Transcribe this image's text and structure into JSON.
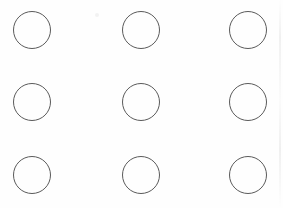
{
  "canvas": {
    "width": 283,
    "height": 208,
    "background_color": "#fefefe",
    "title": "Circle Grid"
  },
  "grid": {
    "rows": 3,
    "columns": 3,
    "shape": "circle",
    "count": 9,
    "circle_diameter": 37,
    "circle_radius": 18.5,
    "stroke_color": "#5a5a5a",
    "stroke_width": 1,
    "fill": "none",
    "column_centers_x": [
      31.5,
      140.5,
      247.5
    ],
    "row_centers_y": [
      29.5,
      101.5,
      174.5
    ],
    "column_spacing": 108,
    "row_spacing": 72.5,
    "circles": [
      {
        "id": "circle-r1-c1",
        "row": 1,
        "column": 1,
        "cx": 31.5,
        "cy": 29.5,
        "r": 18.5
      },
      {
        "id": "circle-r1-c2",
        "row": 1,
        "column": 2,
        "cx": 140.5,
        "cy": 29.5,
        "r": 18.5
      },
      {
        "id": "circle-r1-c3",
        "row": 1,
        "column": 3,
        "cx": 247.5,
        "cy": 29.5,
        "r": 18.5
      },
      {
        "id": "circle-r2-c1",
        "row": 2,
        "column": 1,
        "cx": 31.5,
        "cy": 101.5,
        "r": 18.5
      },
      {
        "id": "circle-r2-c2",
        "row": 2,
        "column": 2,
        "cx": 140.5,
        "cy": 101.5,
        "r": 18.5
      },
      {
        "id": "circle-r2-c3",
        "row": 2,
        "column": 3,
        "cx": 247.5,
        "cy": 101.5,
        "r": 18.5
      },
      {
        "id": "circle-r3-c1",
        "row": 3,
        "column": 1,
        "cx": 31.5,
        "cy": 174.5,
        "r": 18.5
      },
      {
        "id": "circle-r3-c2",
        "row": 3,
        "column": 2,
        "cx": 140.5,
        "cy": 174.5,
        "r": 18.5
      },
      {
        "id": "circle-r3-c3",
        "row": 3,
        "column": 3,
        "cx": 247.5,
        "cy": 174.5,
        "r": 18.5
      }
    ]
  },
  "artifacts": [
    {
      "id": "speck",
      "type": "scan-speck",
      "x": 95,
      "y": 13,
      "color": "#f2f2f2"
    },
    {
      "id": "streak",
      "type": "scan-streak-vertical",
      "x": 279,
      "y": 0,
      "color": "#eeeeee"
    }
  ]
}
